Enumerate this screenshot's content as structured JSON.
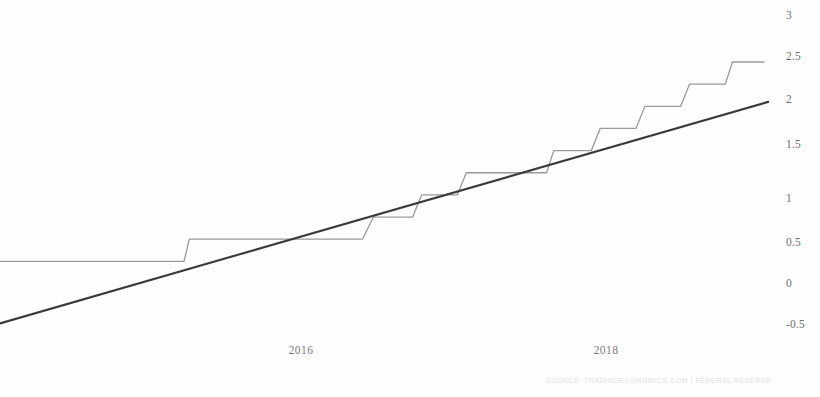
{
  "chart_data": {
    "type": "line",
    "title": "",
    "subtitle": "",
    "xlabel": "",
    "ylabel": "",
    "ylim": [
      -0.75,
      3.1
    ],
    "xlim": [
      2014.9,
      2019.3
    ],
    "grid": false,
    "legend_position": "none",
    "y_ticks": [
      3,
      2.5,
      2,
      1.5,
      1,
      0.5,
      0,
      -0.5
    ],
    "y_tick_labels": [
      "3",
      "2.5",
      "2",
      "1.5",
      "1",
      "0.5",
      "0",
      "-0.5"
    ],
    "x_ticks": [
      2016,
      2018
    ],
    "x_tick_labels": [
      "2016",
      "2018"
    ],
    "series": [
      {
        "name": "Federal Funds Rate",
        "style": "step",
        "color": "#9a9a9a",
        "width": 1.2,
        "points": [
          [
            2014.9,
            0.25
          ],
          [
            2015.93,
            0.25
          ],
          [
            2015.96,
            0.5
          ],
          [
            2016.93,
            0.5
          ],
          [
            2016.99,
            0.75
          ],
          [
            2017.21,
            0.75
          ],
          [
            2017.26,
            1.0
          ],
          [
            2017.46,
            1.0
          ],
          [
            2017.51,
            1.25
          ],
          [
            2017.96,
            1.25
          ],
          [
            2018.0,
            1.5
          ],
          [
            2018.21,
            1.5
          ],
          [
            2018.26,
            1.75
          ],
          [
            2018.46,
            1.75
          ],
          [
            2018.51,
            2.0
          ],
          [
            2018.71,
            2.0
          ],
          [
            2018.76,
            2.25
          ],
          [
            2018.96,
            2.25
          ],
          [
            2019.0,
            2.5
          ],
          [
            2019.18,
            2.5
          ]
        ]
      },
      {
        "name": "Trend",
        "style": "linear",
        "color": "#3a3a3a",
        "width": 2.0,
        "points": [
          [
            2014.9,
            -0.45
          ],
          [
            2019.2,
            2.05
          ]
        ]
      }
    ],
    "source": "SOURCE: TRADINGECONOMICS.COM | FEDERAL RESERVE"
  },
  "axis": {
    "y_labels": [
      {
        "text": "3",
        "y": 16
      },
      {
        "text": "2.5",
        "y": 57
      },
      {
        "text": "2",
        "y": 100
      },
      {
        "text": "1.5",
        "y": 145
      },
      {
        "text": "1",
        "y": 199
      },
      {
        "text": "0.5",
        "y": 243
      },
      {
        "text": "0",
        "y": 284
      },
      {
        "text": "-0.5",
        "y": 325
      }
    ],
    "x_labels": [
      {
        "text": "2016",
        "x": 301
      },
      {
        "text": "2018",
        "x": 606
      }
    ]
  },
  "footer": {
    "source_text": "SOURCE: TRADINGECONOMICS.COM | FEDERAL RESERVE"
  },
  "colors": {
    "step_line": "#9a9a9a",
    "trend_line": "#3a3a3a",
    "tick_text": "#6f6f6f",
    "background": "#fefefe"
  }
}
